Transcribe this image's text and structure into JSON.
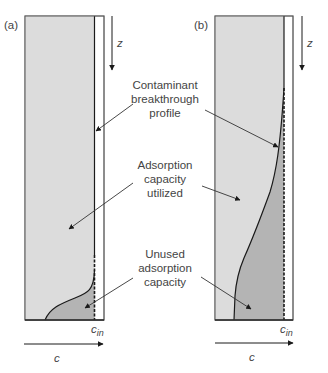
{
  "panels": [
    {
      "id": "a",
      "label": "(a)",
      "z_label": "z",
      "c_in_label": "c",
      "c_in_sub": "in",
      "c_axis_label": "c"
    },
    {
      "id": "b",
      "label": "(b)",
      "z_label": "z",
      "c_in_label": "c",
      "c_in_sub": "in",
      "c_axis_label": "c"
    }
  ],
  "annotations": {
    "breakthrough": [
      "Contaminant",
      "breakthrough",
      "profile"
    ],
    "utilized": [
      "Adsorption",
      "capacity",
      "utilized"
    ],
    "unused": [
      "Unused",
      "adsorption",
      "capacity"
    ]
  },
  "colors": {
    "utilized_fill": "#dcdcdc",
    "unused_fill": "#b4b4b4",
    "outline": "#2a2a2a",
    "text": "#444444"
  }
}
